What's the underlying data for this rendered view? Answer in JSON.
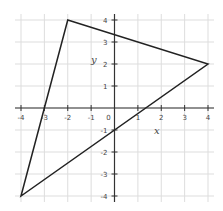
{
  "chart_data": {
    "type": "line",
    "title": "",
    "xlabel": "x",
    "ylabel": "y",
    "xlim": [
      -4,
      4
    ],
    "ylim": [
      -4,
      4
    ],
    "grid": true,
    "x_ticks": [
      -4,
      -3,
      -2,
      -1,
      0,
      1,
      2,
      3,
      4
    ],
    "y_ticks": [
      -4,
      -3,
      -2,
      -1,
      1,
      2,
      3,
      4
    ],
    "x_tick_labels": [
      "-4",
      "-3",
      "-2",
      "-1",
      "0",
      "1",
      "2",
      "3",
      "4"
    ],
    "y_tick_labels": [
      "-4",
      "-3",
      "-2",
      "-1",
      "1",
      "2",
      "3",
      "4"
    ],
    "series": [
      {
        "name": "triangle",
        "closed": true,
        "points": [
          [
            -2,
            4
          ],
          [
            4,
            2
          ],
          [
            -4,
            -4
          ]
        ],
        "color": "#222222"
      }
    ]
  },
  "colors": {
    "grid": "#dddddd",
    "axis": "#333333",
    "line": "#222222"
  }
}
